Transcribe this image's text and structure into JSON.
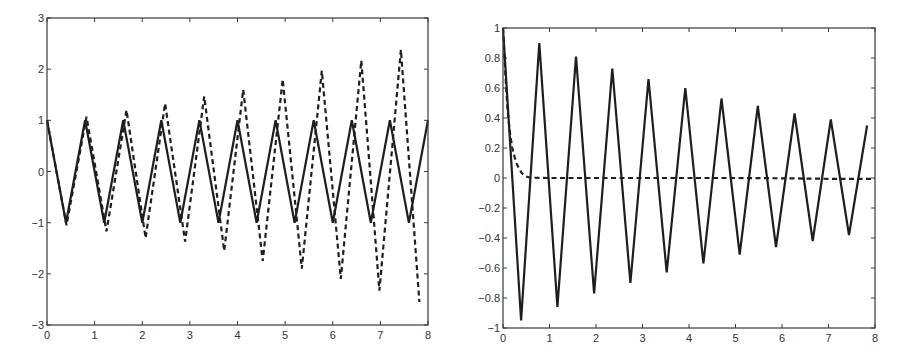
{
  "figure": {
    "background": "#ffffff",
    "line_color": "#1e1e1e",
    "axis_color": "#3a3a3a",
    "label_color": "#333333"
  },
  "chart_data": [
    {
      "type": "line",
      "title": "",
      "xlabel": "",
      "ylabel": "",
      "xlim": [
        0,
        8
      ],
      "ylim": [
        -3,
        3
      ],
      "grid": false,
      "legend": null,
      "frame_px": {
        "left": 47,
        "top": 18,
        "right": 428,
        "bottom": 325
      },
      "xticks": [
        0,
        1,
        2,
        3,
        4,
        5,
        6,
        7,
        8
      ],
      "xtick_labels": [
        "0",
        "1",
        "2",
        "3",
        "4",
        "5",
        "6",
        "7",
        "8"
      ],
      "yticks": [
        -3,
        -2,
        -1,
        0,
        1,
        2,
        3
      ],
      "ytick_labels": [
        "−3",
        "−2",
        "−1",
        "0",
        "1",
        "2",
        "3"
      ],
      "series": [
        {
          "name": "solid",
          "style": "solid",
          "x": [
            0,
            0.4,
            0.8,
            1.2,
            1.6,
            2.0,
            2.4,
            2.8,
            3.2,
            3.6,
            4.0,
            4.4,
            4.8,
            5.2,
            5.6,
            6.0,
            6.4,
            6.8,
            7.2,
            7.6,
            8.0
          ],
          "y": [
            1,
            -1,
            1,
            -1,
            1,
            -1,
            1,
            -1,
            1,
            -1,
            1,
            -1,
            1,
            -1,
            1,
            -1,
            1,
            -1,
            1,
            -1,
            1
          ]
        },
        {
          "name": "dashed",
          "style": "dashed",
          "x": [
            0,
            0.41,
            0.83,
            1.25,
            1.67,
            2.07,
            2.48,
            2.9,
            3.3,
            3.72,
            4.12,
            4.53,
            4.95,
            5.35,
            5.77,
            6.17,
            6.6,
            6.98,
            7.43,
            7.82
          ],
          "y": [
            1,
            -1.05,
            1.07,
            -1.17,
            1.2,
            -1.3,
            1.33,
            -1.37,
            1.47,
            -1.55,
            1.6,
            -1.75,
            1.8,
            -1.9,
            1.97,
            -2.1,
            2.17,
            -2.33,
            2.38,
            -2.55
          ]
        }
      ]
    },
    {
      "type": "line",
      "title": "",
      "xlabel": "",
      "ylabel": "",
      "xlim": [
        0,
        8
      ],
      "ylim": [
        -1,
        1
      ],
      "grid": false,
      "legend": null,
      "frame_px": {
        "left": 503,
        "top": 28,
        "right": 875,
        "bottom": 328
      },
      "xticks": [
        0,
        1,
        2,
        3,
        4,
        5,
        6,
        7,
        8
      ],
      "xtick_labels": [
        "0",
        "1",
        "2",
        "3",
        "4",
        "5",
        "6",
        "7",
        "8"
      ],
      "yticks": [
        -1,
        -0.8,
        -0.6,
        -0.4,
        -0.2,
        0,
        0.2,
        0.4,
        0.6,
        0.8,
        1
      ],
      "ytick_labels": [
        "−1",
        "−0.8",
        "−0.6",
        "−0.4",
        "−0.2",
        "0",
        "0.2",
        "0.4",
        "0.6",
        "0.8",
        "1"
      ],
      "series": [
        {
          "name": "solid",
          "style": "solid",
          "x": [
            0,
            0.39,
            0.78,
            1.17,
            1.57,
            1.96,
            2.35,
            2.74,
            3.13,
            3.52,
            3.92,
            4.31,
            4.7,
            5.09,
            5.48,
            5.87,
            6.27,
            6.66,
            7.05,
            7.44,
            7.83
          ],
          "y": [
            1.0,
            -0.95,
            0.9,
            -0.86,
            0.81,
            -0.77,
            0.73,
            -0.7,
            0.66,
            -0.63,
            0.6,
            -0.57,
            0.53,
            -0.51,
            0.48,
            -0.46,
            0.43,
            -0.42,
            0.39,
            -0.38,
            0.35
          ]
        },
        {
          "name": "dashed",
          "style": "dashed",
          "x": [
            0,
            0.05,
            0.1,
            0.15,
            0.2,
            0.25,
            0.3,
            0.35,
            0.4,
            0.45,
            0.5,
            0.55,
            0.6,
            1.0,
            2.0,
            3.0,
            4.0,
            5.0,
            6.0,
            7.0,
            8.0
          ],
          "y": [
            1.0,
            0.7,
            0.45,
            0.3,
            0.2,
            0.14,
            0.09,
            0.06,
            0.035,
            0.02,
            0.01,
            0.005,
            0.002,
            0,
            0,
            0,
            0,
            0,
            -0.002,
            -0.005,
            -0.006
          ]
        }
      ]
    }
  ]
}
